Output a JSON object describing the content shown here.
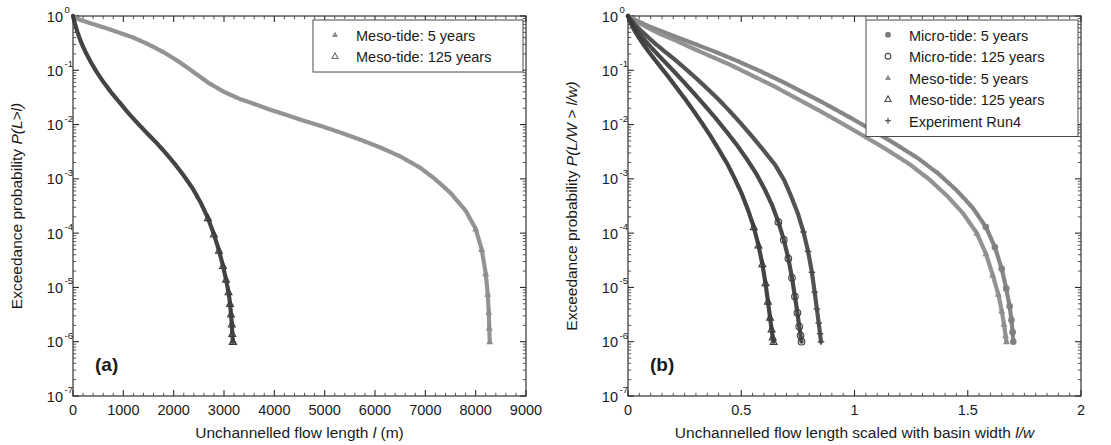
{
  "figure": {
    "panels": [
      {
        "id": "a",
        "label": "(a)",
        "xlabel_parts": {
          "pre": "Unchannelled flow length ",
          "italic": "l",
          "post": " (m)"
        },
        "ylabel_parts": {
          "pre": "Exceedance probability ",
          "italic": "P(L>l)"
        },
        "legend": [
          {
            "label": "Meso-tide: 5 years",
            "marker": "triangle-filled",
            "color": "#8d8d8d"
          },
          {
            "label": "Meso-tide: 125 years",
            "marker": "triangle-open",
            "color": "#6e6e6e"
          }
        ]
      },
      {
        "id": "b",
        "label": "(b)",
        "xlabel_parts": {
          "pre": "Unchannelled flow length scaled with basin width ",
          "italic": "l/w",
          "post": ""
        },
        "ylabel_parts": {
          "pre": "Exceedance probability ",
          "italic": "P(L/W > l/w)"
        },
        "legend": [
          {
            "label": "Micro-tide: 5 years",
            "marker": "circle-filled",
            "color": "#7d7d7d"
          },
          {
            "label": "Micro-tide: 125 years",
            "marker": "circle-open",
            "color": "#4a4a4a"
          },
          {
            "label": "Meso-tide: 5 years",
            "marker": "triangle-filled",
            "color": "#8d8d8d"
          },
          {
            "label": "Meso-tide: 125 years",
            "marker": "triangle-open",
            "color": "#4a4a4a"
          },
          {
            "label": "Experiment Run4",
            "marker": "plus",
            "color": "#555555"
          }
        ]
      }
    ]
  },
  "chart_data": [
    {
      "type": "line",
      "panel": "a",
      "title": "",
      "xlabel": "Unchannelled flow length l (m)",
      "ylabel": "Exceedance probability P(L>l)",
      "xlim": [
        0,
        9000
      ],
      "ylim": [
        1e-07,
        1
      ],
      "yscale": "log",
      "xticks": [
        0,
        1000,
        2000,
        3000,
        4000,
        5000,
        6000,
        7000,
        8000,
        9000
      ],
      "xticklabels": [
        "0",
        "1000",
        "2000",
        "3000",
        "4000",
        "5000",
        "6000",
        "7000",
        "8000",
        "9000"
      ],
      "yticks": [
        1,
        0.1,
        0.01,
        0.001,
        0.0001,
        1e-05,
        1e-06,
        1e-07
      ],
      "yticklabels": [
        "10^0",
        "10^-1",
        "10^-2",
        "10^-3",
        "10^-4",
        "10^-5",
        "10^-6",
        "10^-7"
      ],
      "grid": false,
      "legend_position": "top-right",
      "series": [
        {
          "name": "Meso-tide: 5 years",
          "marker": "triangle-filled",
          "color": "#8d8d8d",
          "x": [
            0,
            60,
            140,
            260,
            420,
            650,
            900,
            1200,
            1500,
            1800,
            2100,
            2400,
            2700,
            3000,
            3300,
            3600,
            3900,
            4200,
            4500,
            4900,
            5300,
            5700,
            6100,
            6500,
            6900,
            7200,
            7500,
            7800,
            8000,
            8120,
            8200,
            8240,
            8260,
            8270,
            8280
          ],
          "y": [
            1.0,
            0.93,
            0.85,
            0.78,
            0.7,
            0.6,
            0.5,
            0.4,
            0.3,
            0.215,
            0.145,
            0.092,
            0.058,
            0.04,
            0.03,
            0.024,
            0.019,
            0.0155,
            0.0125,
            0.0096,
            0.0072,
            0.0053,
            0.0038,
            0.0026,
            0.0016,
            0.00098,
            0.00055,
            0.00026,
            0.00012,
            5e-05,
            1.8e-05,
            7.5e-06,
            3.5e-06,
            1.8e-06,
            1e-06
          ]
        },
        {
          "name": "Meso-tide: 125 years",
          "marker": "triangle-open",
          "color": "#3a3a3a",
          "x": [
            0,
            40,
            90,
            160,
            250,
            360,
            480,
            620,
            780,
            950,
            1120,
            1300,
            1480,
            1660,
            1840,
            2020,
            2200,
            2380,
            2540,
            2680,
            2800,
            2900,
            2980,
            3040,
            3090,
            3120,
            3140,
            3155,
            3165,
            3175,
            3180
          ],
          "y": [
            1.0,
            0.72,
            0.5,
            0.33,
            0.215,
            0.138,
            0.09,
            0.058,
            0.037,
            0.024,
            0.0155,
            0.0102,
            0.0068,
            0.0046,
            0.003,
            0.0019,
            0.00115,
            0.00066,
            0.00036,
            0.00019,
            9.5e-05,
            4.8e-05,
            2.5e-05,
            1.4e-05,
            8.2e-06,
            5e-06,
            3.2e-06,
            2.1e-06,
            1.4e-06,
            1e-06,
            1e-06
          ]
        }
      ]
    },
    {
      "type": "line",
      "panel": "b",
      "title": "",
      "xlabel": "Unchannelled flow length scaled with basin width l/w",
      "ylabel": "Exceedance probability P(L/W > l/w)",
      "xlim": [
        0,
        2
      ],
      "ylim": [
        1e-07,
        1
      ],
      "yscale": "log",
      "xticks": [
        0,
        0.5,
        1,
        1.5,
        2
      ],
      "xticklabels": [
        "0",
        "0.5",
        "1",
        "1.5",
        "2"
      ],
      "yticks": [
        1,
        0.1,
        0.01,
        0.001,
        0.0001,
        1e-05,
        1e-06,
        1e-07
      ],
      "yticklabels": [
        "10^0",
        "10^-1",
        "10^-2",
        "10^-3",
        "10^-4",
        "10^-5",
        "10^-6",
        "10^-7"
      ],
      "grid": false,
      "legend_position": "top-right",
      "series": [
        {
          "name": "Micro-tide: 5 years",
          "marker": "circle-filled",
          "color": "#808080",
          "x": [
            0,
            0.02,
            0.05,
            0.09,
            0.15,
            0.22,
            0.3,
            0.39,
            0.48,
            0.58,
            0.68,
            0.78,
            0.88,
            0.98,
            1.08,
            1.18,
            1.28,
            1.37,
            1.45,
            1.52,
            1.58,
            1.62,
            1.65,
            1.67,
            1.685,
            1.693,
            1.698,
            1.701
          ],
          "y": [
            1.0,
            0.9,
            0.78,
            0.65,
            0.52,
            0.4,
            0.3,
            0.215,
            0.15,
            0.098,
            0.062,
            0.038,
            0.023,
            0.0135,
            0.0078,
            0.0044,
            0.0024,
            0.00125,
            0.00062,
            0.0003,
            0.00013,
            5.5e-05,
            2.2e-05,
            9.5e-06,
            4.5e-06,
            2.5e-06,
            1.5e-06,
            1e-06
          ]
        },
        {
          "name": "Meso-tide: 5 years",
          "marker": "triangle-filled",
          "color": "#8d8d8d",
          "x": [
            0,
            0.02,
            0.05,
            0.09,
            0.14,
            0.21,
            0.28,
            0.36,
            0.45,
            0.54,
            0.64,
            0.74,
            0.84,
            0.94,
            1.04,
            1.14,
            1.24,
            1.33,
            1.41,
            1.48,
            1.54,
            1.58,
            1.61,
            1.635,
            1.65,
            1.66,
            1.667,
            1.671
          ],
          "y": [
            1.0,
            0.88,
            0.74,
            0.6,
            0.47,
            0.355,
            0.26,
            0.185,
            0.127,
            0.083,
            0.052,
            0.031,
            0.0185,
            0.0108,
            0.0062,
            0.0035,
            0.0019,
            0.00098,
            0.00048,
            0.00023,
            0.0001,
            4.2e-05,
            1.7e-05,
            7.5e-06,
            3.7e-06,
            2.1e-06,
            1.3e-06,
            1e-06
          ]
        },
        {
          "name": "Experiment Run4",
          "marker": "plus",
          "color": "#4a4a4a",
          "x": [
            0,
            0.012,
            0.03,
            0.055,
            0.085,
            0.12,
            0.16,
            0.205,
            0.25,
            0.3,
            0.35,
            0.4,
            0.45,
            0.5,
            0.55,
            0.6,
            0.65,
            0.69,
            0.72,
            0.75,
            0.775,
            0.795,
            0.812,
            0.824,
            0.834,
            0.842,
            0.848,
            0.852
          ],
          "y": [
            1.0,
            0.86,
            0.7,
            0.55,
            0.42,
            0.31,
            0.225,
            0.16,
            0.11,
            0.072,
            0.046,
            0.029,
            0.0175,
            0.0103,
            0.0059,
            0.0033,
            0.0018,
            0.00094,
            0.00048,
            0.00023,
            0.000105,
            4.6e-05,
            1.9e-05,
            8.2e-06,
            4e-06,
            2.2e-06,
            1.4e-06,
            1e-06
          ]
        },
        {
          "name": "Micro-tide: 125 years",
          "marker": "circle-open",
          "color": "#3f3f3f",
          "x": [
            0,
            0.01,
            0.025,
            0.045,
            0.07,
            0.1,
            0.134,
            0.172,
            0.212,
            0.254,
            0.298,
            0.343,
            0.389,
            0.435,
            0.481,
            0.525,
            0.566,
            0.603,
            0.636,
            0.664,
            0.688,
            0.708,
            0.724,
            0.737,
            0.748,
            0.756,
            0.762,
            0.766
          ],
          "y": [
            1.0,
            0.84,
            0.66,
            0.5,
            0.375,
            0.27,
            0.19,
            0.13,
            0.087,
            0.056,
            0.035,
            0.0215,
            0.0128,
            0.0074,
            0.0042,
            0.0023,
            0.00125,
            0.00065,
            0.00033,
            0.00016,
            7.5e-05,
            3.4e-05,
            1.5e-05,
            6.8e-06,
            3.4e-06,
            1.9e-06,
            1.3e-06,
            1e-06
          ]
        },
        {
          "name": "Meso-tide: 125 years",
          "marker": "triangle-open",
          "color": "#3a3a3a",
          "x": [
            0,
            0.008,
            0.02,
            0.037,
            0.058,
            0.083,
            0.112,
            0.144,
            0.178,
            0.214,
            0.251,
            0.289,
            0.327,
            0.365,
            0.402,
            0.438,
            0.472,
            0.503,
            0.531,
            0.555,
            0.576,
            0.593,
            0.607,
            0.618,
            0.627,
            0.634,
            0.639,
            0.643
          ],
          "y": [
            1.0,
            0.82,
            0.63,
            0.47,
            0.345,
            0.245,
            0.17,
            0.115,
            0.076,
            0.048,
            0.03,
            0.018,
            0.0106,
            0.0061,
            0.0034,
            0.0019,
            0.001,
            0.00052,
            0.00026,
            0.00013,
            6e-05,
            2.7e-05,
            1.2e-05,
            5.5e-06,
            2.8e-06,
            1.7e-06,
            1.2e-06,
            1e-06
          ]
        }
      ]
    }
  ]
}
